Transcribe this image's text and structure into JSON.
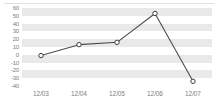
{
  "chart_data": {
    "type": "line",
    "title": "",
    "xlabel": "",
    "ylabel": "",
    "categories": [
      "12/03",
      "12/04",
      "12/05",
      "12/06",
      "12/07"
    ],
    "values": [
      -1,
      13,
      16,
      53,
      -34
    ],
    "series": [
      {
        "name": "series-1",
        "values": [
          -1,
          13,
          16,
          53,
          -34
        ]
      }
    ],
    "ylim": [
      -40,
      60
    ],
    "y_ticks": [
      60,
      50,
      40,
      30,
      20,
      10,
      0,
      -10,
      -20,
      -30,
      -40
    ],
    "y_tick_labels": [
      "60",
      "50",
      "40",
      "30",
      "20",
      "10",
      "0",
      "-10",
      "-20",
      "-30",
      "-40"
    ],
    "grid": true,
    "grid_style": "alternating-horizontal-bands",
    "legend": false,
    "legend_position": "none",
    "marker": "open-circle",
    "colors": {
      "line": "#4d4d4d",
      "marker_fill": "#ffffff",
      "marker_stroke": "#3f3f3f",
      "band": "#e9e9e9",
      "plot_background": "#ffffff",
      "tick_label": "#808080",
      "top_rule": "#e2e2e2"
    }
  }
}
